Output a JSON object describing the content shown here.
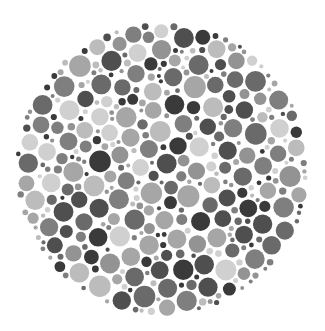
{
  "image": {
    "subject": "Dot-pattern test plate (grayscale)",
    "background": "#ffffff",
    "plate": {
      "cx": 162,
      "cy": 169,
      "r": 147
    },
    "dot_palette": [
      "#3a3a3a",
      "#4f4f4f",
      "#6a6a6a",
      "#7f7f7f",
      "#939393",
      "#a6a6a6",
      "#bcbcbc",
      "#d0d0d0"
    ],
    "dot_radius_range": [
      2,
      11
    ],
    "seed": 7
  }
}
